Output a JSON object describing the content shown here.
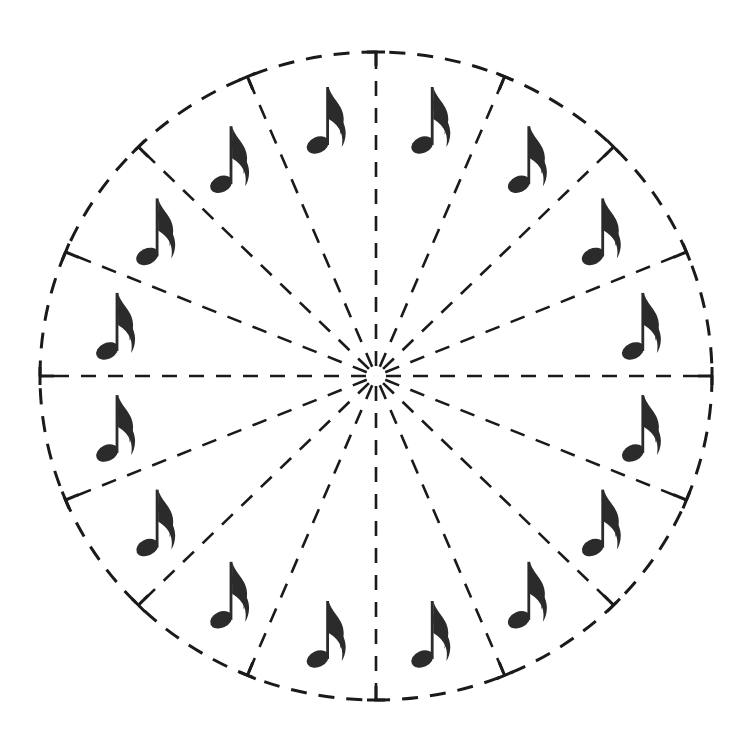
{
  "canvas": {
    "width": 748,
    "height": 750,
    "background": "#ffffff"
  },
  "wheel": {
    "center": [
      376,
      376
    ],
    "radius_x": 336,
    "radius_y": 324,
    "segments": 16,
    "stroke_color": "#1a1a1a",
    "outline_style": "dashed",
    "spoke_style": "dashed",
    "hub_radius": 10,
    "tick_marks": "T-shaped ticks where each spoke meets the outer circle"
  },
  "notes": {
    "glyph": "sixteenth-note",
    "count": 16,
    "color": "#2b2b2b",
    "orientation": "upright",
    "placement": "one per segment, centered in each wedge"
  }
}
